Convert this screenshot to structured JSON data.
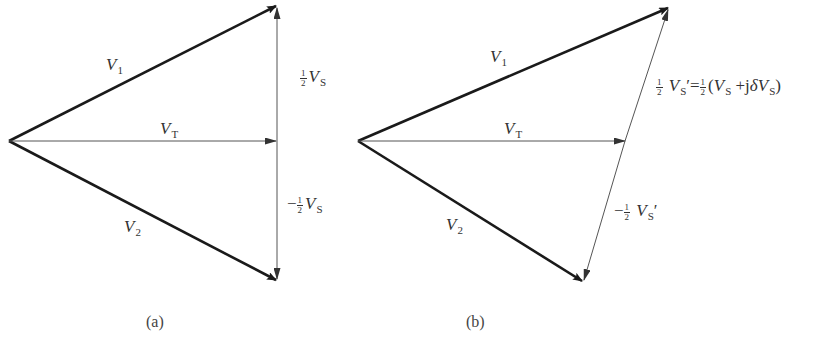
{
  "figure_a": {
    "caption": "(a)",
    "vectors": {
      "v1": {
        "symbol": "V",
        "sub": "1"
      },
      "v2": {
        "symbol": "V",
        "sub": "2"
      },
      "vt": {
        "symbol": "V",
        "sub": "T"
      },
      "half_vs": {
        "prefix": "",
        "frac_num": "1",
        "frac_den": "2",
        "symbol": "V",
        "sub": "S"
      },
      "neg_half_vs": {
        "prefix": "−",
        "frac_num": "1",
        "frac_den": "2",
        "symbol": "V",
        "sub": "S"
      }
    }
  },
  "figure_b": {
    "caption": "(b)",
    "vectors": {
      "v1": {
        "symbol": "V",
        "sub": "1"
      },
      "v2": {
        "symbol": "V",
        "sub": "2"
      },
      "vt": {
        "symbol": "V",
        "sub": "T"
      },
      "half_vs_prime": {
        "frac_num": "1",
        "frac_den": "2",
        "symbol": "V",
        "sub": "S",
        "prime": "′",
        "equals": "=",
        "rhs_frac_num": "1",
        "rhs_frac_den": "2",
        "rhs_open": "(",
        "rhs_v1": "V",
        "rhs_sub1": "S",
        "rhs_plus": " +j",
        "rhs_delta": "δ",
        "rhs_v2": "V",
        "rhs_sub2": "S",
        "rhs_close": ")"
      },
      "neg_half_vs_prime": {
        "prefix": "−",
        "frac_num": "1",
        "frac_den": "2",
        "symbol": "V",
        "sub": "S",
        "prime": "′"
      }
    }
  },
  "colors": {
    "line": "#1a1a1a",
    "thin_line": "#555555",
    "background": "#ffffff"
  }
}
